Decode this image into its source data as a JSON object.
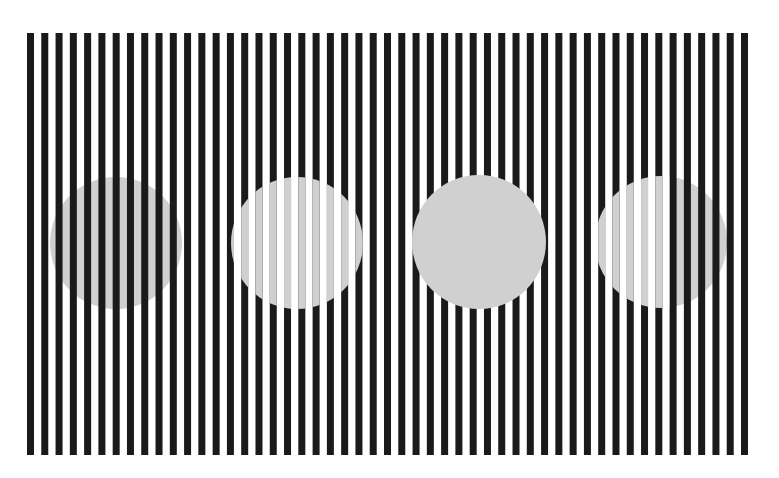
{
  "figure": {
    "type": "white-illusion",
    "canvas": {
      "width": 779,
      "height": 478,
      "background": "#ffffff"
    },
    "stripes": {
      "count": 51,
      "x_start": 27,
      "period": 14.28,
      "stripe_width": 7,
      "y_top": 33,
      "y_bottom": 455,
      "color": "#1a1a1a"
    },
    "gray": "#d0d0d0",
    "disks": [
      {
        "id": "disk-1",
        "cx": 116,
        "cy": 243,
        "r": 66,
        "mode": "behind-stripes"
      },
      {
        "id": "disk-2",
        "cx": 297,
        "cy": 243,
        "r": 66,
        "mode": "on-stripes"
      },
      {
        "id": "disk-3",
        "cx": 479,
        "cy": 242,
        "r": 67,
        "mode": "solid"
      },
      {
        "id": "disk-4",
        "cx": 661,
        "cy": 242,
        "r": 66,
        "mode": "split",
        "split_x": 670
      }
    ]
  }
}
